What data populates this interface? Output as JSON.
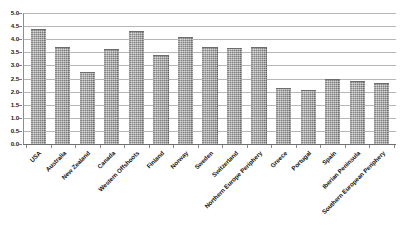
{
  "chart_data": {
    "type": "bar",
    "title": "",
    "subtitle": "",
    "xlabel": "",
    "ylabel": "",
    "ylim": [
      0,
      5
    ],
    "ytick_step": 0.5,
    "grid": true,
    "legend": null,
    "legend_position": "none",
    "bar_color": "#a3a3a3",
    "bar_edge_color": "#6d6d6d",
    "gridline_color": "#b7b7b7",
    "axis_color": "#6f6f6f",
    "label_rotation": -45,
    "ytick_labels": [
      "5.0",
      "4.5",
      "4.0",
      "3.5",
      "3.0",
      "2.5",
      "2.0",
      "1.5",
      "1.0",
      "0.5",
      "0.0"
    ],
    "ytick_values": [
      5.0,
      4.5,
      4.0,
      3.5,
      3.0,
      2.5,
      2.0,
      1.5,
      1.0,
      0.5,
      0.0
    ],
    "categories": [
      "USA",
      "Australia",
      "New Zealand",
      "Canada",
      "Western Offshoots",
      "Finland",
      "Norway",
      "Sweden",
      "Switzerland",
      "Northern Europe Periphery",
      "Greece",
      "Portugal",
      "Spain",
      "Iberian Peninsula",
      "Southern European Periphery"
    ],
    "values": [
      4.4,
      3.7,
      2.73,
      3.63,
      4.3,
      3.38,
      4.09,
      3.7,
      3.65,
      3.7,
      2.15,
      2.08,
      2.47,
      2.4,
      2.34
    ]
  }
}
